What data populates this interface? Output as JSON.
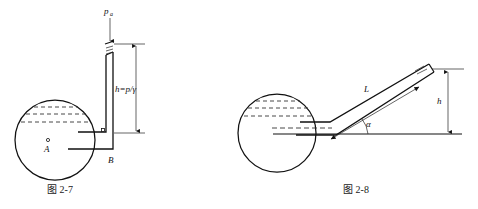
{
  "sheet": {
    "background": "#ffffff",
    "ink": "#111111",
    "dash_color": "#333333"
  },
  "figures": [
    {
      "id": "fig-2-7",
      "caption": "图 2-7",
      "title_note": "vertical piezometer tube on spherical vessel",
      "labels": {
        "pressure_symbol": "p",
        "pressure_subscript": "a",
        "height_expression": "h=p/γ",
        "point_a": "A",
        "point_b": "B"
      },
      "icons": [
        "down-arrow-icon",
        "double-arrow-dimension-icon",
        "point-marker-icon"
      ]
    },
    {
      "id": "fig-2-8",
      "caption": "图 2-8",
      "title_note": "inclined piezometer tube on spherical vessel",
      "labels": {
        "length_symbol": "L",
        "angle_symbol": "α",
        "height_symbol": "h"
      },
      "icons": [
        "double-arrow-dimension-icon",
        "angle-arc-icon"
      ]
    }
  ]
}
